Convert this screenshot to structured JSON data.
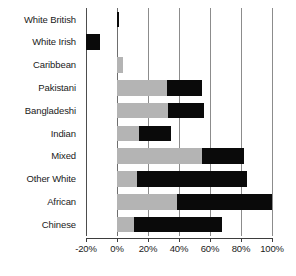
{
  "chart_data": {
    "type": "bar",
    "orientation": "horizontal",
    "title": "",
    "subtitle": "",
    "xlabel": "",
    "ylabel": "",
    "xlim": [
      -20,
      100
    ],
    "grid": true,
    "legend": "none",
    "categories": [
      "White British",
      "White Irish",
      "Caribbean",
      "Pakistani",
      "Bangladeshi",
      "Indian",
      "Mixed",
      "Other White",
      "African",
      "Chinese"
    ],
    "tick_labels": [
      "-20%",
      "0%",
      "20%",
      "40%",
      "60%",
      "80%",
      "100%"
    ],
    "tick_values": [
      -20,
      0,
      20,
      40,
      60,
      80,
      100
    ],
    "series": [
      {
        "name": "gray-segment",
        "color": "#b4b4b4",
        "start": [
          0,
          -20,
          0,
          0,
          0,
          0,
          0,
          0,
          0,
          0
        ],
        "end": [
          0,
          -11,
          4,
          32,
          33,
          14,
          55,
          13,
          39,
          11
        ],
        "values": [
          0,
          9,
          4,
          32,
          33,
          14,
          55,
          13,
          39,
          11
        ]
      },
      {
        "name": "black-segment",
        "color": "#0a0a0a",
        "start": [
          0,
          -20,
          4,
          32,
          33,
          14,
          55,
          13,
          39,
          11
        ],
        "end": [
          1,
          -11,
          4,
          55,
          56,
          35,
          82,
          84,
          100,
          68
        ],
        "values": [
          1,
          9,
          0,
          23,
          23,
          21,
          27,
          71,
          61,
          57
        ]
      }
    ],
    "totals": [
      1,
      -20,
      4,
      55,
      56,
      35,
      82,
      84,
      100,
      68
    ]
  },
  "colors": {
    "gray": "#b4b4b4",
    "black": "#0a0a0a",
    "gridline": "#8c8c8c",
    "axis": "#3d3d3d",
    "background": "#ffffff",
    "text": "#1a1a1a"
  }
}
